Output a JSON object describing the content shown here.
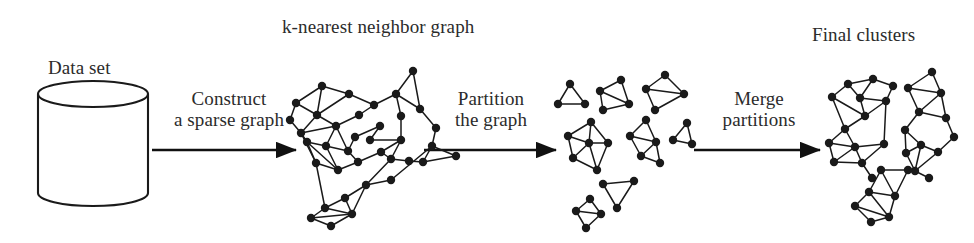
{
  "figure": {
    "background_color": "#ffffff",
    "ink_color": "#1a1a1a",
    "text_color": "#2b2b2b"
  },
  "captions": {
    "knn_graph": "k-nearest neighbor graph",
    "final_clusters": "Final clusters",
    "data_set": "Data set"
  },
  "steps": [
    {
      "id": "construct",
      "line1": "Construct",
      "line2": "a sparse graph"
    },
    {
      "id": "partition",
      "line1": "Partition",
      "line2": "the graph"
    },
    {
      "id": "merge",
      "line1": "Merge",
      "line2": "partitions"
    }
  ],
  "chart_data": {
    "type": "diagram",
    "stages": [
      {
        "name": "Data set",
        "glyph": "cylinder",
        "node_count": 0
      },
      {
        "name": "k-nearest neighbor graph",
        "glyph": "graph",
        "node_count": 37
      },
      {
        "name": "Partitioned subgraphs",
        "glyph": "graph-clusters",
        "cluster_count": 8,
        "node_count": 32
      },
      {
        "name": "Final clusters",
        "glyph": "graph-clusters",
        "cluster_count": 3,
        "node_count": 36
      }
    ],
    "arrows": [
      "Construct a sparse graph",
      "Partition the graph",
      "Merge partitions"
    ]
  },
  "geometry": {
    "cylinder": {
      "cx": 93,
      "top_y": 94,
      "bottom_y": 193,
      "rx": 55,
      "ry": 13
    },
    "arrows": [
      {
        "id": "arrow-construct",
        "x1": 152,
        "y1": 150,
        "x2": 296,
        "y2": 150
      },
      {
        "id": "arrow-partition",
        "x1": 424,
        "y1": 150,
        "x2": 556,
        "y2": 150
      },
      {
        "id": "arrow-merge",
        "x1": 694,
        "y1": 150,
        "x2": 820,
        "y2": 150
      }
    ],
    "knn_graph": {
      "nodes": [
        [
          322,
          86
        ],
        [
          296,
          103
        ],
        [
          349,
          94
        ],
        [
          317,
          115
        ],
        [
          359,
          115
        ],
        [
          336,
          126
        ],
        [
          301,
          133
        ],
        [
          355,
          137
        ],
        [
          380,
          126
        ],
        [
          307,
          142
        ],
        [
          326,
          146
        ],
        [
          348,
          151
        ],
        [
          316,
          163
        ],
        [
          338,
          170
        ],
        [
          358,
          162
        ],
        [
          381,
          152
        ],
        [
          401,
          140
        ],
        [
          366,
          185
        ],
        [
          391,
          180
        ],
        [
          345,
          198
        ],
        [
          325,
          208
        ],
        [
          352,
          214
        ],
        [
          331,
          226
        ],
        [
          311,
          218
        ],
        [
          396,
          94
        ],
        [
          420,
          109
        ],
        [
          413,
          71
        ],
        [
          436,
          128
        ],
        [
          401,
          116
        ],
        [
          432,
          146
        ],
        [
          456,
          156
        ],
        [
          423,
          162
        ],
        [
          409,
          161
        ],
        [
          391,
          159
        ],
        [
          374,
          105
        ],
        [
          290,
          120
        ],
        [
          370,
          140
        ]
      ],
      "edges": [
        [
          0,
          1
        ],
        [
          0,
          2
        ],
        [
          0,
          3
        ],
        [
          1,
          3
        ],
        [
          1,
          35
        ],
        [
          35,
          6
        ],
        [
          2,
          3
        ],
        [
          2,
          34
        ],
        [
          3,
          5
        ],
        [
          3,
          6
        ],
        [
          5,
          4
        ],
        [
          5,
          6
        ],
        [
          4,
          34
        ],
        [
          34,
          24
        ],
        [
          5,
          10
        ],
        [
          6,
          9
        ],
        [
          9,
          10
        ],
        [
          9,
          12
        ],
        [
          10,
          11
        ],
        [
          10,
          13
        ],
        [
          11,
          7
        ],
        [
          7,
          8
        ],
        [
          8,
          36
        ],
        [
          36,
          16
        ],
        [
          11,
          14
        ],
        [
          12,
          13
        ],
        [
          12,
          20
        ],
        [
          13,
          14
        ],
        [
          14,
          15
        ],
        [
          15,
          16
        ],
        [
          16,
          28
        ],
        [
          28,
          24
        ],
        [
          24,
          26
        ],
        [
          24,
          25
        ],
        [
          26,
          25
        ],
        [
          25,
          27
        ],
        [
          27,
          29
        ],
        [
          29,
          30
        ],
        [
          29,
          31
        ],
        [
          31,
          32
        ],
        [
          32,
          33
        ],
        [
          33,
          15
        ],
        [
          33,
          17
        ],
        [
          17,
          18
        ],
        [
          18,
          29
        ],
        [
          17,
          19
        ],
        [
          19,
          20
        ],
        [
          19,
          21
        ],
        [
          20,
          21
        ],
        [
          20,
          23
        ],
        [
          21,
          22
        ],
        [
          22,
          23
        ],
        [
          23,
          21
        ],
        [
          6,
          12
        ],
        [
          9,
          13
        ],
        [
          5,
          11
        ],
        [
          16,
          33
        ],
        [
          31,
          30
        ],
        [
          17,
          21
        ]
      ]
    },
    "partition_clusters": [
      {
        "id": "p1",
        "nodes": [
          [
            570,
            84
          ],
          [
            558,
            104
          ],
          [
            585,
            104
          ]
        ],
        "edges": [
          [
            0,
            1
          ],
          [
            0,
            2
          ],
          [
            1,
            2
          ]
        ]
      },
      {
        "id": "p2",
        "nodes": [
          [
            600,
            91
          ],
          [
            621,
            80
          ],
          [
            629,
            104
          ],
          [
            603,
            110
          ]
        ],
        "edges": [
          [
            0,
            1
          ],
          [
            0,
            2
          ],
          [
            0,
            3
          ],
          [
            1,
            2
          ],
          [
            2,
            3
          ]
        ]
      },
      {
        "id": "p3",
        "nodes": [
          [
            665,
            75
          ],
          [
            646,
            89
          ],
          [
            684,
            94
          ],
          [
            655,
            110
          ]
        ],
        "edges": [
          [
            0,
            1
          ],
          [
            0,
            2
          ],
          [
            1,
            2
          ],
          [
            1,
            3
          ],
          [
            2,
            3
          ]
        ]
      },
      {
        "id": "p4",
        "nodes": [
          [
            591,
            122
          ],
          [
            568,
            136
          ],
          [
            608,
            143
          ],
          [
            573,
            158
          ],
          [
            597,
            170
          ],
          [
            589,
            143
          ]
        ],
        "edges": [
          [
            0,
            1
          ],
          [
            0,
            2
          ],
          [
            0,
            5
          ],
          [
            1,
            3
          ],
          [
            1,
            5
          ],
          [
            2,
            5
          ],
          [
            2,
            4
          ],
          [
            3,
            4
          ],
          [
            3,
            5
          ],
          [
            4,
            5
          ]
        ]
      },
      {
        "id": "p5",
        "nodes": [
          [
            646,
            120
          ],
          [
            630,
            136
          ],
          [
            656,
            142
          ],
          [
            641,
            156
          ],
          [
            660,
            163
          ]
        ],
        "edges": [
          [
            0,
            1
          ],
          [
            0,
            2
          ],
          [
            1,
            2
          ],
          [
            1,
            3
          ],
          [
            2,
            3
          ],
          [
            2,
            4
          ],
          [
            3,
            4
          ]
        ]
      },
      {
        "id": "p6",
        "nodes": [
          [
            687,
            123
          ],
          [
            673,
            140
          ],
          [
            692,
            144
          ]
        ],
        "edges": [
          [
            0,
            1
          ],
          [
            0,
            2
          ],
          [
            1,
            2
          ]
        ]
      },
      {
        "id": "p7",
        "nodes": [
          [
            603,
            184
          ],
          [
            634,
            181
          ],
          [
            617,
            208
          ]
        ],
        "edges": [
          [
            0,
            1
          ],
          [
            0,
            2
          ],
          [
            1,
            2
          ]
        ]
      },
      {
        "id": "p8",
        "nodes": [
          [
            590,
            199
          ],
          [
            576,
            211
          ],
          [
            601,
            214
          ],
          [
            586,
            228
          ]
        ],
        "edges": [
          [
            0,
            1
          ],
          [
            0,
            2
          ],
          [
            1,
            2
          ],
          [
            1,
            3
          ],
          [
            2,
            3
          ]
        ]
      }
    ],
    "final_clusters": [
      {
        "id": "f1",
        "nodes": [
          [
            848,
            84
          ],
          [
            873,
            79
          ],
          [
            832,
            97
          ],
          [
            860,
            98
          ],
          [
            893,
            86
          ],
          [
            886,
            101
          ],
          [
            865,
            116
          ],
          [
            845,
            129
          ],
          [
            829,
            143
          ],
          [
            855,
            147
          ],
          [
            884,
            144
          ],
          [
            834,
            162
          ],
          [
            862,
            163
          ],
          [
            872,
            178
          ]
        ],
        "edges": [
          [
            0,
            1
          ],
          [
            0,
            2
          ],
          [
            0,
            3
          ],
          [
            1,
            3
          ],
          [
            1,
            4
          ],
          [
            3,
            5
          ],
          [
            4,
            5
          ],
          [
            5,
            6
          ],
          [
            3,
            6
          ],
          [
            2,
            6
          ],
          [
            6,
            7
          ],
          [
            5,
            10
          ],
          [
            7,
            9
          ],
          [
            7,
            8
          ],
          [
            8,
            9
          ],
          [
            9,
            10
          ],
          [
            8,
            11
          ],
          [
            9,
            11
          ],
          [
            9,
            12
          ],
          [
            11,
            12
          ],
          [
            12,
            13
          ],
          [
            10,
            12
          ],
          [
            2,
            7
          ]
        ]
      },
      {
        "id": "f2",
        "nodes": [
          [
            932,
            72
          ],
          [
            908,
            88
          ],
          [
            941,
            93
          ],
          [
            919,
            112
          ],
          [
            946,
            118
          ],
          [
            905,
            130
          ],
          [
            954,
            137
          ],
          [
            921,
            145
          ],
          [
            938,
            152
          ],
          [
            906,
            153
          ],
          [
            915,
            171
          ],
          [
            929,
            178
          ]
        ],
        "edges": [
          [
            0,
            1
          ],
          [
            0,
            2
          ],
          [
            1,
            2
          ],
          [
            1,
            3
          ],
          [
            2,
            3
          ],
          [
            2,
            4
          ],
          [
            3,
            4
          ],
          [
            3,
            5
          ],
          [
            4,
            6
          ],
          [
            5,
            7
          ],
          [
            5,
            9
          ],
          [
            7,
            8
          ],
          [
            6,
            8
          ],
          [
            7,
            9
          ],
          [
            9,
            10
          ],
          [
            7,
            10
          ],
          [
            10,
            11
          ],
          [
            8,
            10
          ]
        ]
      },
      {
        "id": "f3",
        "nodes": [
          [
            881,
            170
          ],
          [
            908,
            170
          ],
          [
            869,
            192
          ],
          [
            895,
            196
          ],
          [
            855,
            206
          ],
          [
            871,
            222
          ],
          [
            889,
            217
          ]
        ],
        "edges": [
          [
            0,
            1
          ],
          [
            0,
            2
          ],
          [
            0,
            3
          ],
          [
            1,
            3
          ],
          [
            2,
            3
          ],
          [
            2,
            4
          ],
          [
            4,
            5
          ],
          [
            4,
            6
          ],
          [
            5,
            6
          ],
          [
            2,
            6
          ],
          [
            3,
            6
          ]
        ]
      }
    ]
  }
}
